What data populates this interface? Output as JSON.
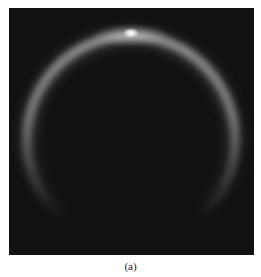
{
  "figure": {
    "caption": "(a)",
    "panel": {
      "background_color": "#121212",
      "ring": {
        "color": "#bdbdbd",
        "center": [
          122,
          132
        ],
        "radius": 105,
        "visible_from_deg": 200,
        "visible_to_deg": -20,
        "fade": "bottom"
      },
      "highlight": {
        "color": "#ffffff",
        "position": [
          122,
          25
        ]
      }
    }
  }
}
